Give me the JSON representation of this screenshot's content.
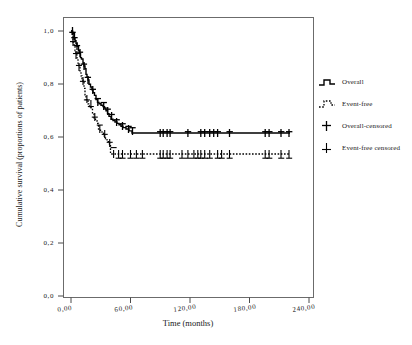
{
  "chart_data": {
    "type": "line",
    "subtype": "kaplan-meier-step",
    "title": "",
    "xlabel": "Time (months)",
    "ylabel": "Cumulative survival (proportions of patients)",
    "xlim": [
      0,
      240
    ],
    "ylim": [
      0.0,
      1.0
    ],
    "xticks": [
      0,
      60,
      120,
      180,
      240
    ],
    "xtick_labels": [
      "0,00",
      "60,00",
      "120,00",
      "180,00",
      "240,00"
    ],
    "yticks": [
      0.0,
      0.2,
      0.4,
      0.6,
      0.8,
      1.0
    ],
    "ytick_labels": [
      "0,0",
      "0,2",
      "0,4",
      "0,6",
      "0,8",
      "1,0"
    ],
    "grid": false,
    "legend_position": "right-outside",
    "decimal_separator": "comma",
    "series": [
      {
        "name": "Overall",
        "style": "solid",
        "color": "#000000",
        "plateau_value": 0.62,
        "plateau_start_month": 65,
        "last_observed_month": 220,
        "points": [
          [
            0,
            1.0
          ],
          [
            1.5,
            0.995
          ],
          [
            2.5,
            0.99
          ],
          [
            3,
            0.975
          ],
          [
            4,
            0.965
          ],
          [
            5,
            0.955
          ],
          [
            6,
            0.945
          ],
          [
            7.5,
            0.93
          ],
          [
            8.5,
            0.92
          ],
          [
            9.5,
            0.905
          ],
          [
            10.5,
            0.9
          ],
          [
            12,
            0.885
          ],
          [
            13,
            0.875
          ],
          [
            14,
            0.865
          ],
          [
            15,
            0.845
          ],
          [
            16,
            0.835
          ],
          [
            17,
            0.825
          ],
          [
            18,
            0.81
          ],
          [
            19.5,
            0.8
          ],
          [
            21,
            0.79
          ],
          [
            22,
            0.78
          ],
          [
            23.5,
            0.77
          ],
          [
            25,
            0.755
          ],
          [
            26.5,
            0.745
          ],
          [
            28,
            0.74
          ],
          [
            30,
            0.735
          ],
          [
            32,
            0.73
          ],
          [
            33.5,
            0.725
          ],
          [
            35,
            0.715
          ],
          [
            36.5,
            0.705
          ],
          [
            38,
            0.695
          ],
          [
            40,
            0.685
          ],
          [
            42,
            0.675
          ],
          [
            44,
            0.67
          ],
          [
            46,
            0.665
          ],
          [
            48,
            0.66
          ],
          [
            50,
            0.655
          ],
          [
            52,
            0.65
          ],
          [
            54,
            0.645
          ],
          [
            57,
            0.64
          ],
          [
            60,
            0.635
          ],
          [
            63,
            0.628
          ],
          [
            65,
            0.62
          ],
          [
            220,
            0.62
          ]
        ],
        "censored_months": [
          1.5,
          3.5,
          6,
          9,
          13,
          17,
          22,
          27,
          33,
          37,
          41,
          46,
          52,
          58,
          62,
          90,
          93,
          97,
          100,
          118,
          131,
          135,
          140,
          144,
          148,
          160,
          196,
          200,
          212,
          220
        ]
      },
      {
        "name": "Event-free",
        "style": "dotted",
        "color": "#000000",
        "plateau_value": 0.52,
        "plateau_start_month": 45,
        "last_observed_month": 220,
        "points": [
          [
            0,
            1.0
          ],
          [
            1,
            0.985
          ],
          [
            2,
            0.96
          ],
          [
            3,
            0.945
          ],
          [
            4,
            0.93
          ],
          [
            5,
            0.915
          ],
          [
            6,
            0.9
          ],
          [
            7,
            0.885
          ],
          [
            8,
            0.87
          ],
          [
            9,
            0.855
          ],
          [
            10,
            0.84
          ],
          [
            11,
            0.825
          ],
          [
            12,
            0.81
          ],
          [
            13,
            0.805
          ],
          [
            14,
            0.78
          ],
          [
            15,
            0.755
          ],
          [
            16,
            0.74
          ],
          [
            17,
            0.735
          ],
          [
            18,
            0.725
          ],
          [
            19.5,
            0.715
          ],
          [
            21,
            0.705
          ],
          [
            22.5,
            0.69
          ],
          [
            24,
            0.675
          ],
          [
            25.5,
            0.665
          ],
          [
            27,
            0.655
          ],
          [
            28.5,
            0.645
          ],
          [
            30,
            0.625
          ],
          [
            32,
            0.615
          ],
          [
            33.5,
            0.61
          ],
          [
            35,
            0.6
          ],
          [
            37,
            0.59
          ],
          [
            38.5,
            0.58
          ],
          [
            40,
            0.57
          ],
          [
            41.5,
            0.565
          ],
          [
            43,
            0.56
          ],
          [
            44,
            0.555
          ],
          [
            45,
            0.52
          ],
          [
            220,
            0.52
          ]
        ],
        "censored_months": [
          2,
          5,
          8,
          12,
          16,
          20,
          24,
          29,
          34,
          39,
          43,
          48,
          52,
          60,
          66,
          72,
          90,
          93,
          97,
          100,
          112,
          118,
          124,
          128,
          131,
          135,
          140,
          148,
          152,
          160,
          196,
          200,
          212,
          220
        ]
      }
    ],
    "legend_entries": [
      {
        "label": "Overall",
        "marker": "solid-step-line"
      },
      {
        "label": "Event-free",
        "marker": "dotted-step-line"
      },
      {
        "label": "Overall-censored",
        "marker": "plus-bold"
      },
      {
        "label": "Event-free censored",
        "marker": "plus-thin"
      }
    ]
  },
  "axes": {
    "y_tick_labels": [
      "1,0",
      "0,8",
      "0,6",
      "0,4",
      "0,2",
      "0,0"
    ],
    "x_tick_labels": [
      "0,00",
      "60,00",
      "120,00",
      "180,00",
      "240,00"
    ],
    "x_title": "Time (months)",
    "y_title": "Cumulative survival (proportions of patients)"
  },
  "legend": {
    "entries": [
      {
        "label": "Overall"
      },
      {
        "label": "Event-free"
      },
      {
        "label": "Overall-censored"
      },
      {
        "label": "Event-free censored"
      }
    ]
  },
  "colors": {
    "line": "#000000",
    "frame": "#6b6b6b",
    "background": "#ffffff",
    "text": "#1a1a1a"
  }
}
